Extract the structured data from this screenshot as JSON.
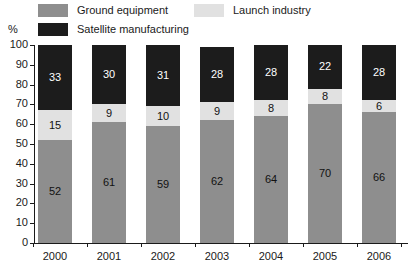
{
  "chart_data": {
    "type": "bar",
    "subtype": "stacked-bar-100-percent",
    "title": "",
    "xlabel": "",
    "ylabel": "%",
    "ylim": [
      0,
      100
    ],
    "ytick_step": 10,
    "yticks": [
      100,
      90,
      80,
      70,
      60,
      50,
      40,
      30,
      20,
      10,
      0
    ],
    "grid": false,
    "legend_position": "top",
    "categories": [
      "2000",
      "2001",
      "2002",
      "2003",
      "2004",
      "2005",
      "2006"
    ],
    "series": [
      {
        "name": "Ground equipment",
        "color": "#8e8e8e",
        "values": [
          52,
          61,
          59,
          62,
          64,
          70,
          66
        ]
      },
      {
        "name": "Launch industry",
        "color": "#e1e1e1",
        "values": [
          15,
          9,
          10,
          9,
          8,
          8,
          6
        ]
      },
      {
        "name": "Satellite manufacturing",
        "color": "#1c1c1c",
        "values": [
          33,
          30,
          31,
          28,
          28,
          22,
          28
        ]
      }
    ]
  },
  "legend": {
    "items": [
      {
        "label": "Ground equipment"
      },
      {
        "label": "Launch industry"
      },
      {
        "label": "Satellite manufacturing"
      }
    ]
  },
  "axis": {
    "unit_label": "%"
  }
}
